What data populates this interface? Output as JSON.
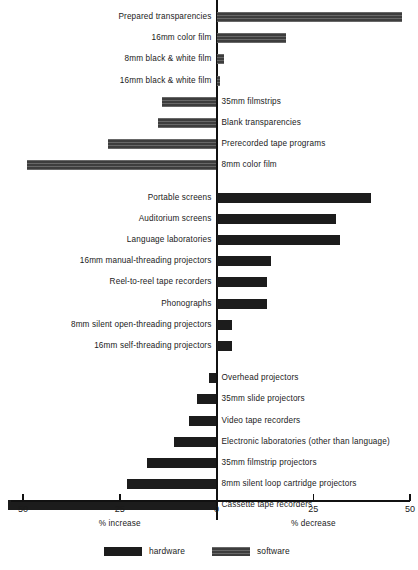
{
  "chart_data": {
    "type": "bar",
    "orientation": "horizontal",
    "title": "",
    "subtitle": "",
    "xlabel_left": "% increase",
    "xlabel_right": "% decrease",
    "ylabel": "",
    "grid": false,
    "legend_position": "bottom-center",
    "xlim": [
      -50,
      50
    ],
    "xticks": [
      {
        "label": "50",
        "value": -50
      },
      {
        "label": "25",
        "value": -25
      },
      {
        "label": "0",
        "value": 0
      },
      {
        "label": "25",
        "value": 25
      },
      {
        "label": "50",
        "value": 50
      }
    ],
    "axis_note": "Negative values are plotted to the LEFT of zero and read as '% increase'; positive values plotted to the RIGHT of zero read as '% decrease'.",
    "legend": [
      {
        "name": "hardware",
        "color": "#1c1c1c"
      },
      {
        "name": "software",
        "color": "#3d3d3d"
      }
    ],
    "categories": [
      "Prepared transparencies",
      "16mm color film",
      "8mm black & white film",
      "16mm black & white film",
      "35mm filmstrips",
      "Blank transparencies",
      "Prerecorded tape programs",
      "8mm color film",
      "Portable screens",
      "Auditorium screens",
      "Language laboratories",
      "16mm manual-threading projectors",
      "Reel-to-reel tape recorders",
      "Phonographs",
      "8mm silent open-threading projectors",
      "16mm self-threading projectors",
      "Overhead projectors",
      "35mm slide projectors",
      "Video tape recorders",
      "Electronic laboratories (other than language)",
      "35mm filmstrip projectors",
      "8mm silent loop cartridge projectors",
      "Cassette tape recorders"
    ],
    "bars": [
      {
        "label": "Prepared transparencies",
        "series": "software",
        "direction": "decrease",
        "value": 48,
        "label_side": "left"
      },
      {
        "label": "16mm color film",
        "series": "software",
        "direction": "decrease",
        "value": 18,
        "label_side": "left"
      },
      {
        "label": "8mm black & white film",
        "series": "software",
        "direction": "decrease",
        "value": 2,
        "label_side": "left"
      },
      {
        "label": "16mm black & white film",
        "series": "software",
        "direction": "decrease",
        "value": 1,
        "label_side": "left"
      },
      {
        "label": "35mm filmstrips",
        "series": "software",
        "direction": "increase",
        "value": 14,
        "label_side": "right"
      },
      {
        "label": "Blank transparencies",
        "series": "software",
        "direction": "increase",
        "value": 15,
        "label_side": "right"
      },
      {
        "label": "Prerecorded tape programs",
        "series": "software",
        "direction": "increase",
        "value": 28,
        "label_side": "right"
      },
      {
        "label": "8mm color film",
        "series": "software",
        "direction": "increase",
        "value": 49,
        "label_side": "right"
      },
      {
        "label": "Portable screens",
        "series": "hardware",
        "direction": "decrease",
        "value": 40,
        "label_side": "left"
      },
      {
        "label": "Auditorium screens",
        "series": "hardware",
        "direction": "decrease",
        "value": 31,
        "label_side": "left"
      },
      {
        "label": "Language laboratories",
        "series": "hardware",
        "direction": "decrease",
        "value": 32,
        "label_side": "left"
      },
      {
        "label": "16mm manual-threading projectors",
        "series": "hardware",
        "direction": "decrease",
        "value": 14,
        "label_side": "left"
      },
      {
        "label": "Reel-to-reel tape recorders",
        "series": "hardware",
        "direction": "decrease",
        "value": 13,
        "label_side": "left"
      },
      {
        "label": "Phonographs",
        "series": "hardware",
        "direction": "decrease",
        "value": 13,
        "label_side": "left"
      },
      {
        "label": "8mm silent open-threading projectors",
        "series": "hardware",
        "direction": "decrease",
        "value": 4,
        "label_side": "left"
      },
      {
        "label": "16mm self-threading projectors",
        "series": "hardware",
        "direction": "decrease",
        "value": 4,
        "label_side": "left"
      },
      {
        "label": "Overhead projectors",
        "series": "hardware",
        "direction": "increase",
        "value": 2,
        "label_side": "right"
      },
      {
        "label": "35mm slide projectors",
        "series": "hardware",
        "direction": "increase",
        "value": 5,
        "label_side": "right"
      },
      {
        "label": "Video tape recorders",
        "series": "hardware",
        "direction": "increase",
        "value": 7,
        "label_side": "right"
      },
      {
        "label": "Electronic laboratories (other than language)",
        "series": "hardware",
        "direction": "increase",
        "value": 11,
        "label_side": "right"
      },
      {
        "label": "35mm filmstrip projectors",
        "series": "hardware",
        "direction": "increase",
        "value": 18,
        "label_side": "right"
      },
      {
        "label": "8mm silent loop cartridge projectors",
        "series": "hardware",
        "direction": "increase",
        "value": 23,
        "label_side": "right"
      },
      {
        "label": "Cassette tape recorders",
        "series": "hardware",
        "direction": "increase",
        "value": 54,
        "label_side": "right"
      }
    ]
  },
  "legend": {
    "hardware_label": "hardware",
    "software_label": "software"
  },
  "axis": {
    "left_caption": "% increase",
    "right_caption": "% decrease"
  }
}
